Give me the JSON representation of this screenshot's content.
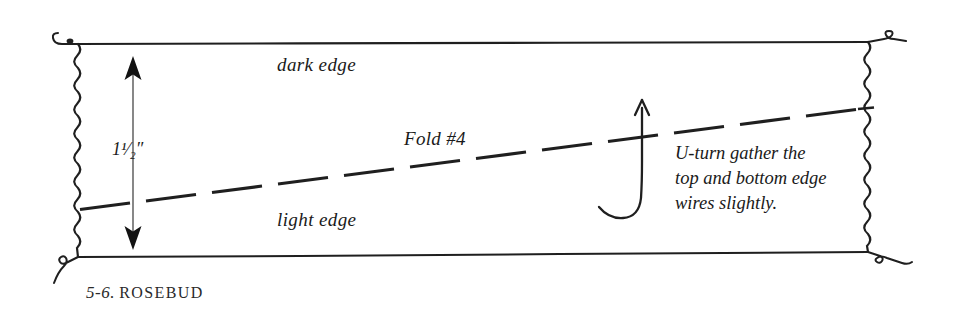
{
  "figure": {
    "caption_number": "5-6.",
    "caption_title": "ROSEBUD",
    "labels": {
      "dark_edge": "dark edge",
      "light_edge": "light edge",
      "fold": "Fold #4",
      "dimension_whole": "1",
      "dimension_fraction": "1/2",
      "dimension_unit": "″",
      "dimension_full": "1¹⁄₂″"
    },
    "note": {
      "line1": "U-turn gather the",
      "line2": "top and bottom edge",
      "line3": "wires slightly."
    },
    "icons": {
      "fold_line": "dashed-fold-line",
      "dimension_arrow": "double-headed-vertical-arrow",
      "u_turn_arrow": "u-turn-arrow",
      "left_wire": "wavy-wire-left-edge",
      "right_wire": "wavy-wire-right-edge",
      "top_edge": "straight-edge-top",
      "bottom_edge": "straight-edge-bottom",
      "corner_hook_top_left": "wire-hook-top-left",
      "corner_hook_top_right": "wire-loop-top-right",
      "corner_hook_bottom_left": "wire-hook-bottom-left",
      "corner_hook_bottom_right": "wire-hook-bottom-right"
    },
    "colors": {
      "ink": "#1a1a1a",
      "background": "#ffffff",
      "thin_rule": "#6a6a6a"
    },
    "geometry": {
      "top_edge_y_left": 44,
      "top_edge_y_right": 42,
      "bottom_edge_y_left": 257,
      "bottom_edge_y_right": 252,
      "left_edge_x": 78,
      "right_edge_x": 868,
      "fold_left_y": 209,
      "fold_right_y": 108
    }
  }
}
